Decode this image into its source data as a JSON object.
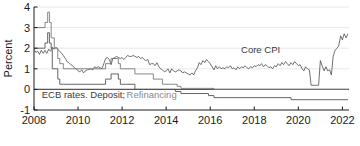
{
  "chart_data": {
    "type": "line",
    "title": "",
    "xlabel": "",
    "ylabel": "Percent",
    "xlim": [
      2008.0,
      2022.3
    ],
    "ylim": [
      -1,
      4
    ],
    "grid": true,
    "grid_values": [
      1,
      2,
      3,
      4
    ],
    "zero_line": 0,
    "legend_position": "inline-annotations",
    "x_ticks": [
      "2008",
      "2010",
      "2012",
      "2014",
      "2016",
      "2018",
      "2020",
      "2022"
    ],
    "x_tick_values": [
      2008,
      2010,
      2012,
      2014,
      2016,
      2018,
      2020,
      2022
    ],
    "y_ticks": [
      "-1",
      "0",
      "1",
      "2",
      "3",
      "4"
    ],
    "y_tick_values": [
      -1,
      0,
      1,
      2,
      3,
      4
    ],
    "annotations": [
      {
        "text": "Core CPI",
        "x": 2017.4,
        "y": 1.78,
        "color": "#3a3a3a"
      },
      {
        "text": "ECB rates. Deposit;",
        "x": 2008.35,
        "y": -0.42,
        "color": "#3a3a3a"
      },
      {
        "text": "Refinancing",
        "x": 2012.2,
        "y": -0.42,
        "color": "#8a8a8a"
      }
    ],
    "series": [
      {
        "name": "Core CPI",
        "color": "#4d4d4d",
        "width": 0.8,
        "step": false,
        "points": [
          [
            2008.0,
            1.95
          ],
          [
            2008.08,
            1.8
          ],
          [
            2008.17,
            1.85
          ],
          [
            2008.25,
            1.7
          ],
          [
            2008.33,
            1.9
          ],
          [
            2008.42,
            1.75
          ],
          [
            2008.5,
            1.9
          ],
          [
            2008.58,
            1.75
          ],
          [
            2008.67,
            1.95
          ],
          [
            2008.75,
            1.85
          ],
          [
            2008.83,
            2.05
          ],
          [
            2008.92,
            1.95
          ],
          [
            2009.0,
            2.05
          ],
          [
            2009.08,
            1.95
          ],
          [
            2009.17,
            1.85
          ],
          [
            2009.25,
            1.75
          ],
          [
            2009.33,
            1.65
          ],
          [
            2009.42,
            1.5
          ],
          [
            2009.5,
            1.35
          ],
          [
            2009.58,
            1.3
          ],
          [
            2009.67,
            1.2
          ],
          [
            2009.75,
            1.15
          ],
          [
            2009.83,
            1.05
          ],
          [
            2009.92,
            1.0
          ],
          [
            2010.0,
            0.9
          ],
          [
            2010.08,
            0.85
          ],
          [
            2010.17,
            0.95
          ],
          [
            2010.25,
            0.8
          ],
          [
            2010.33,
            0.9
          ],
          [
            2010.42,
            0.95
          ],
          [
            2010.5,
            0.98
          ],
          [
            2010.58,
            1.0
          ],
          [
            2010.67,
            0.95
          ],
          [
            2010.75,
            1.1
          ],
          [
            2010.83,
            1.05
          ],
          [
            2010.92,
            1.1
          ],
          [
            2011.0,
            1.05
          ],
          [
            2011.08,
            1.0
          ],
          [
            2011.17,
            1.25
          ],
          [
            2011.25,
            1.5
          ],
          [
            2011.33,
            1.55
          ],
          [
            2011.42,
            1.45
          ],
          [
            2011.5,
            1.2
          ],
          [
            2011.58,
            1.5
          ],
          [
            2011.67,
            1.55
          ],
          [
            2011.75,
            1.6
          ],
          [
            2011.83,
            1.55
          ],
          [
            2011.92,
            1.5
          ],
          [
            2012.0,
            1.55
          ],
          [
            2012.08,
            1.45
          ],
          [
            2012.17,
            1.55
          ],
          [
            2012.25,
            1.65
          ],
          [
            2012.33,
            1.6
          ],
          [
            2012.42,
            1.6
          ],
          [
            2012.5,
            1.65
          ],
          [
            2012.58,
            1.6
          ],
          [
            2012.67,
            1.55
          ],
          [
            2012.75,
            1.6
          ],
          [
            2012.83,
            1.5
          ],
          [
            2012.92,
            1.55
          ],
          [
            2013.0,
            1.45
          ],
          [
            2013.08,
            1.4
          ],
          [
            2013.17,
            1.45
          ],
          [
            2013.25,
            1.2
          ],
          [
            2013.33,
            1.25
          ],
          [
            2013.42,
            1.25
          ],
          [
            2013.5,
            1.15
          ],
          [
            2013.58,
            1.3
          ],
          [
            2013.67,
            1.1
          ],
          [
            2013.75,
            1.0
          ],
          [
            2013.83,
            0.95
          ],
          [
            2013.92,
            0.85
          ],
          [
            2014.0,
            0.9
          ],
          [
            2014.08,
            1.0
          ],
          [
            2014.17,
            0.8
          ],
          [
            2014.25,
            1.0
          ],
          [
            2014.33,
            0.9
          ],
          [
            2014.42,
            0.85
          ],
          [
            2014.5,
            0.9
          ],
          [
            2014.58,
            0.95
          ],
          [
            2014.67,
            0.9
          ],
          [
            2014.75,
            0.8
          ],
          [
            2014.83,
            0.85
          ],
          [
            2014.92,
            0.8
          ],
          [
            2015.0,
            0.75
          ],
          [
            2015.08,
            0.7
          ],
          [
            2015.17,
            0.8
          ],
          [
            2015.25,
            0.7
          ],
          [
            2015.33,
            0.9
          ],
          [
            2015.42,
            1.05
          ],
          [
            2015.5,
            1.3
          ],
          [
            2015.58,
            1.2
          ],
          [
            2015.67,
            1.4
          ],
          [
            2015.75,
            1.3
          ],
          [
            2015.83,
            1.45
          ],
          [
            2015.92,
            1.35
          ],
          [
            2016.0,
            1.25
          ],
          [
            2016.08,
            1.1
          ],
          [
            2016.17,
            0.95
          ],
          [
            2016.25,
            1.15
          ],
          [
            2016.33,
            1.0
          ],
          [
            2016.42,
            1.1
          ],
          [
            2016.5,
            1.0
          ],
          [
            2016.58,
            1.05
          ],
          [
            2016.67,
            1.0
          ],
          [
            2016.75,
            1.1
          ],
          [
            2016.83,
            1.05
          ],
          [
            2016.92,
            1.15
          ],
          [
            2017.0,
            1.0
          ],
          [
            2017.08,
            1.05
          ],
          [
            2017.17,
            0.95
          ],
          [
            2017.25,
            1.1
          ],
          [
            2017.33,
            1.0
          ],
          [
            2017.42,
            1.1
          ],
          [
            2017.5,
            1.05
          ],
          [
            2017.58,
            1.15
          ],
          [
            2017.67,
            1.05
          ],
          [
            2017.75,
            1.0
          ],
          [
            2017.83,
            1.1
          ],
          [
            2017.92,
            1.05
          ],
          [
            2018.0,
            1.15
          ],
          [
            2018.08,
            1.1
          ],
          [
            2018.17,
            1.2
          ],
          [
            2018.25,
            1.15
          ],
          [
            2018.33,
            1.25
          ],
          [
            2018.42,
            1.1
          ],
          [
            2018.5,
            1.2
          ],
          [
            2018.58,
            1.15
          ],
          [
            2018.67,
            1.05
          ],
          [
            2018.75,
            1.1
          ],
          [
            2018.83,
            1.0
          ],
          [
            2018.92,
            1.15
          ],
          [
            2019.0,
            1.1
          ],
          [
            2019.08,
            1.25
          ],
          [
            2019.17,
            1.15
          ],
          [
            2019.25,
            1.3
          ],
          [
            2019.33,
            1.2
          ],
          [
            2019.42,
            1.35
          ],
          [
            2019.5,
            1.25
          ],
          [
            2019.58,
            1.15
          ],
          [
            2019.67,
            1.3
          ],
          [
            2019.75,
            1.2
          ],
          [
            2019.83,
            1.35
          ],
          [
            2019.92,
            1.25
          ],
          [
            2020.0,
            1.15
          ],
          [
            2020.08,
            1.2
          ],
          [
            2020.17,
            1.0
          ],
          [
            2020.25,
            0.9
          ],
          [
            2020.33,
            1.1
          ],
          [
            2020.42,
            1.0
          ],
          [
            2020.5,
            0.95
          ],
          [
            2020.58,
            0.2
          ],
          [
            2020.67,
            0.2
          ],
          [
            2020.75,
            0.2
          ],
          [
            2020.83,
            0.2
          ],
          [
            2020.92,
            0.2
          ],
          [
            2021.0,
            1.4
          ],
          [
            2021.08,
            1.15
          ],
          [
            2021.17,
            0.9
          ],
          [
            2021.25,
            1.1
          ],
          [
            2021.33,
            0.9
          ],
          [
            2021.42,
            0.95
          ],
          [
            2021.5,
            0.7
          ],
          [
            2021.58,
            1.6
          ],
          [
            2021.67,
            1.9
          ],
          [
            2021.75,
            2.0
          ],
          [
            2021.83,
            2.1
          ],
          [
            2021.92,
            2.6
          ],
          [
            2022.0,
            2.4
          ],
          [
            2022.08,
            2.7
          ],
          [
            2022.17,
            2.5
          ],
          [
            2022.25,
            2.7
          ]
        ]
      },
      {
        "name": "Refinancing",
        "color": "#7a7a7a",
        "width": 0.9,
        "step": true,
        "points": [
          [
            2008.0,
            3.0
          ],
          [
            2008.5,
            3.0
          ],
          [
            2008.5,
            3.25
          ],
          [
            2008.62,
            3.25
          ],
          [
            2008.62,
            3.75
          ],
          [
            2008.7,
            3.75
          ],
          [
            2008.7,
            3.25
          ],
          [
            2008.78,
            3.25
          ],
          [
            2008.78,
            2.5
          ],
          [
            2008.92,
            2.5
          ],
          [
            2008.92,
            2.0
          ],
          [
            2009.08,
            2.0
          ],
          [
            2009.08,
            1.5
          ],
          [
            2009.17,
            1.5
          ],
          [
            2009.17,
            1.25
          ],
          [
            2009.33,
            1.25
          ],
          [
            2009.33,
            1.0
          ],
          [
            2011.25,
            1.0
          ],
          [
            2011.25,
            1.25
          ],
          [
            2011.5,
            1.25
          ],
          [
            2011.5,
            1.5
          ],
          [
            2011.83,
            1.5
          ],
          [
            2011.83,
            1.25
          ],
          [
            2011.92,
            1.25
          ],
          [
            2011.92,
            1.0
          ],
          [
            2012.58,
            1.0
          ],
          [
            2012.58,
            0.75
          ],
          [
            2013.42,
            0.75
          ],
          [
            2013.42,
            0.5
          ],
          [
            2013.83,
            0.5
          ],
          [
            2013.83,
            0.25
          ],
          [
            2014.5,
            0.25
          ],
          [
            2014.5,
            0.15
          ],
          [
            2014.67,
            0.15
          ],
          [
            2014.67,
            0.05
          ],
          [
            2016.17,
            0.05
          ],
          [
            2016.17,
            0.0
          ],
          [
            2022.25,
            0.0
          ]
        ]
      },
      {
        "name": "Deposit",
        "color": "#555555",
        "width": 0.9,
        "step": true,
        "points": [
          [
            2008.0,
            2.0
          ],
          [
            2008.5,
            2.0
          ],
          [
            2008.5,
            2.25
          ],
          [
            2008.62,
            2.25
          ],
          [
            2008.62,
            2.75
          ],
          [
            2008.7,
            2.75
          ],
          [
            2008.7,
            2.25
          ],
          [
            2008.78,
            2.25
          ],
          [
            2008.78,
            2.0
          ],
          [
            2008.83,
            2.0
          ],
          [
            2008.83,
            1.0
          ],
          [
            2009.08,
            1.0
          ],
          [
            2009.08,
            0.5
          ],
          [
            2009.17,
            0.5
          ],
          [
            2009.17,
            0.25
          ],
          [
            2009.33,
            0.25
          ],
          [
            2009.33,
            0.25
          ],
          [
            2011.25,
            0.25
          ],
          [
            2011.25,
            0.5
          ],
          [
            2011.5,
            0.5
          ],
          [
            2011.5,
            0.75
          ],
          [
            2011.83,
            0.75
          ],
          [
            2011.83,
            0.5
          ],
          [
            2011.92,
            0.5
          ],
          [
            2011.92,
            0.25
          ],
          [
            2012.58,
            0.25
          ],
          [
            2012.58,
            0.0
          ],
          [
            2014.42,
            0.0
          ],
          [
            2014.42,
            -0.1
          ],
          [
            2014.67,
            -0.1
          ],
          [
            2014.67,
            -0.2
          ],
          [
            2015.92,
            -0.2
          ],
          [
            2015.92,
            -0.3
          ],
          [
            2016.17,
            -0.3
          ],
          [
            2016.17,
            -0.4
          ],
          [
            2019.67,
            -0.4
          ],
          [
            2019.67,
            -0.5
          ],
          [
            2022.25,
            -0.5
          ]
        ]
      }
    ]
  },
  "axis": {
    "y_label_text": "Percent"
  },
  "caption": {
    "text": ""
  }
}
